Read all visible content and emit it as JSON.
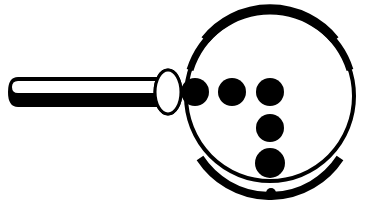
{
  "figure": {
    "colors": {
      "ink": "#000000",
      "paper": "#ffffff"
    },
    "lens": {
      "cx": 270,
      "cy": 95,
      "r": 87
    },
    "handle": {
      "x": 8,
      "y": 77,
      "width": 160,
      "height": 30
    },
    "joint": {
      "cx": 168,
      "cy": 92,
      "rx": 13,
      "ry": 22
    },
    "dots": [
      {
        "cx": 193,
        "cy": 92,
        "r": 14
      },
      {
        "cx": 232,
        "cy": 92,
        "r": 14
      },
      {
        "cx": 270,
        "cy": 92,
        "r": 14
      },
      {
        "cx": 270,
        "cy": 128,
        "r": 14
      },
      {
        "cx": 270,
        "cy": 163,
        "r": 15
      }
    ],
    "small_dot": {
      "cx": 271,
      "cy": 193,
      "r": 5
    }
  }
}
